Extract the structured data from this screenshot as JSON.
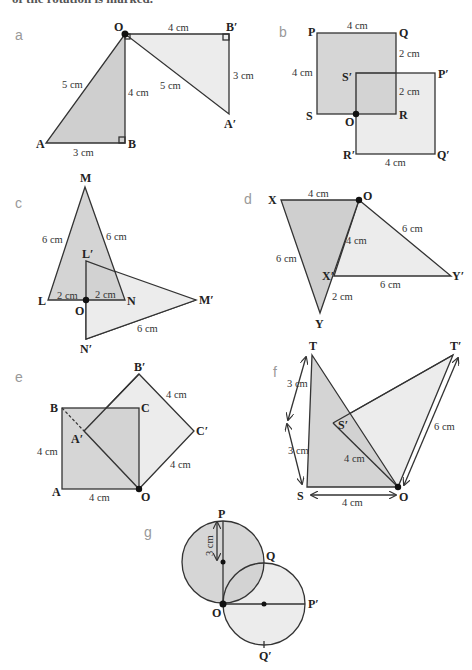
{
  "header": {
    "caption_fragment": "of the rotation is marked."
  },
  "colors": {
    "object_fill": "#cfcfcf",
    "image_fill": "#ececec",
    "stroke": "#333333",
    "panel_label": "#999999"
  },
  "panels": {
    "a": {
      "label": "a",
      "points": {
        "O": "O",
        "B1": "B′",
        "A": "A",
        "B": "B",
        "A1": "A′"
      },
      "dims": {
        "top": "4 cm",
        "OA": "5 cm",
        "OB": "4 cm",
        "AB": "3 cm",
        "OA1": "5 cm",
        "B1A1": "3 cm"
      }
    },
    "b": {
      "label": "b",
      "points": {
        "P": "P",
        "Q": "Q",
        "S1": "S′",
        "P1": "P′",
        "S": "S",
        "O": "O",
        "R": "R",
        "R1": "R′",
        "Q1": "Q′"
      },
      "dims": {
        "top": "4 cm",
        "left": "4 cm",
        "upper": "2 cm",
        "lower": "2 cm",
        "bottom": "4 cm"
      }
    },
    "c": {
      "label": "c",
      "points": {
        "M": "M",
        "L1": "L′",
        "L": "L",
        "O": "O",
        "N": "N",
        "M1": "M′",
        "N1": "N′"
      },
      "dims": {
        "LM": "6 cm",
        "MN": "6 cm",
        "LO": "2 cm",
        "ON": "2 cm",
        "N1M1": "6 cm"
      }
    },
    "d": {
      "label": "d",
      "points": {
        "X": "X",
        "O": "O",
        "X1": "X′",
        "Y1": "Y′",
        "Y": "Y"
      },
      "dims": {
        "XO": "4 cm",
        "XY": "6 cm",
        "OX1": "4 cm",
        "OY1": "6 cm",
        "X1Y1": "6 cm",
        "X1Y": "2 cm"
      }
    },
    "e": {
      "label": "e",
      "points": {
        "B1": "B′",
        "B": "B",
        "C": "C",
        "A1": "A′",
        "C1": "C′",
        "A": "A",
        "O": "O"
      },
      "dims": {
        "B1C1": "4 cm",
        "AB": "4 cm",
        "C1O": "4 cm",
        "AO": "4 cm"
      }
    },
    "f": {
      "label": "f",
      "points": {
        "T": "T",
        "T1": "T′",
        "S1": "S′",
        "S": "S",
        "O": "O"
      },
      "dims": {
        "upper": "3 cm",
        "lower": "3 cm",
        "OS1": "4 cm",
        "SO": "4 cm",
        "OT1": "6 cm"
      }
    },
    "g": {
      "label": "g",
      "points": {
        "P": "P",
        "Q": "Q",
        "O": "O",
        "P1": "P′",
        "Q1": "Q′"
      },
      "dims": {
        "radius": "3 cm"
      }
    }
  }
}
